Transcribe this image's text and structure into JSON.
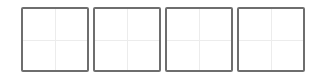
{
  "grid": {
    "border_color": "#6e6e6e",
    "guide_color": "#ececec",
    "cells": [
      {
        "value": ""
      },
      {
        "value": ""
      },
      {
        "value": ""
      },
      {
        "value": ""
      }
    ]
  }
}
